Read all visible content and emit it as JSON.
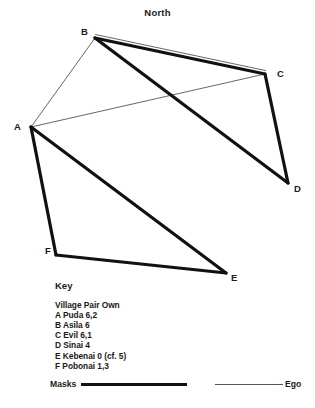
{
  "title": "North",
  "nodes": [
    {
      "id": "A",
      "label": "A",
      "x": 31,
      "y": 127,
      "label_x": 14,
      "label_y": 122
    },
    {
      "id": "B",
      "label": "B",
      "x": 95,
      "y": 38,
      "label_x": 81,
      "label_y": 27
    },
    {
      "id": "C",
      "label": "C",
      "x": 265,
      "y": 74,
      "label_x": 277,
      "label_y": 69
    },
    {
      "id": "D",
      "label": "D",
      "x": 288,
      "y": 183,
      "label_x": 294,
      "label_y": 184
    },
    {
      "id": "E",
      "label": "E",
      "x": 226,
      "y": 273,
      "label_x": 231,
      "label_y": 273
    },
    {
      "id": "F",
      "label": "F",
      "x": 56,
      "y": 255,
      "label_x": 45,
      "label_y": 246
    }
  ],
  "edges": [
    {
      "from": "A",
      "to": "B",
      "style": "ego"
    },
    {
      "from": "A",
      "to": "C",
      "style": "ego"
    },
    {
      "from": "B",
      "to": "C",
      "style": "ego",
      "offset": -3.5
    },
    {
      "from": "B",
      "to": "C",
      "style": "masks"
    },
    {
      "from": "B",
      "to": "D",
      "style": "masks"
    },
    {
      "from": "C",
      "to": "D",
      "style": "masks"
    },
    {
      "from": "A",
      "to": "F",
      "style": "masks"
    },
    {
      "from": "A",
      "to": "E",
      "style": "masks"
    },
    {
      "from": "F",
      "to": "E",
      "style": "masks"
    }
  ],
  "key": {
    "title": "Key",
    "columns_header": "Village Pair Own",
    "entries": [
      "A Puda 6,2",
      "B Asila 6",
      "C Evil 6,1",
      "D Sinai 4",
      "E Kebenai 0 (cf. 5)",
      "F Pobonai 1,3"
    ]
  },
  "legend": {
    "masks_label": "Masks",
    "ego_label": "Ego"
  },
  "colors": {
    "stroke": "#111111",
    "thin_stroke": "#555555",
    "background": "#ffffff",
    "text": "#1a1a1a"
  },
  "stroke_widths": {
    "masks": 3.2,
    "ego": 0.9
  }
}
